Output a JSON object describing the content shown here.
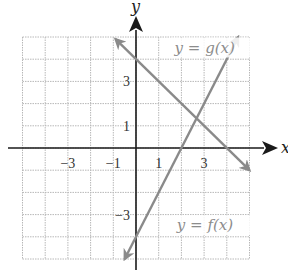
{
  "chart_data": {
    "type": "line",
    "title": "",
    "xlabel": "x",
    "ylabel": "y",
    "xlim": [
      -5,
      5
    ],
    "ylim": [
      -5,
      5
    ],
    "grid": true,
    "x_ticks": [
      -3,
      -1,
      1,
      3
    ],
    "x_tick_labels": [
      "−3",
      "−1",
      "1",
      "3"
    ],
    "y_ticks": [
      3,
      1,
      -3
    ],
    "y_tick_labels": [
      "3",
      "1",
      "−3"
    ],
    "series": [
      {
        "name": "y = g(x)",
        "equation": "y = -x + 4",
        "points": [
          [
            -0.9,
            4.9
          ],
          [
            5,
            -1
          ]
        ],
        "color": "#8a8a8a"
      },
      {
        "name": "y = f(x)",
        "equation": "y = 2x - 4",
        "points": [
          [
            -0.5,
            -5
          ],
          [
            4.5,
            5
          ]
        ],
        "color": "#8a8a8a"
      }
    ],
    "annotations": [
      {
        "text": "y = g(x)",
        "x": 1.7,
        "y": 4.3
      },
      {
        "text": "y = f(x)",
        "x": 1.8,
        "y": -3.7
      }
    ],
    "intersection": [
      2.67,
      1.33
    ]
  }
}
